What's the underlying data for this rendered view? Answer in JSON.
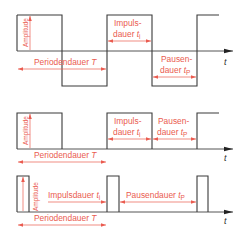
{
  "diagrams": [
    {
      "name": "symmetric-rectangular-wave",
      "labels": {
        "amplitude": "Amplitude",
        "impuls_line1": "Impuls-",
        "impuls_line2": "dauer ",
        "impuls_sym": "t",
        "impuls_sub": "i",
        "pause_line1": "Pausen-",
        "pause_line2": "dauer ",
        "pause_sym": "t",
        "pause_sub": "P",
        "period": "Periodendauer ",
        "period_sym": "T",
        "axis": "t"
      }
    },
    {
      "name": "unipolar-pulse-wave",
      "labels": {
        "amplitude": "Amplitude",
        "impuls_line1": "Impuls-",
        "impuls_line2": "dauer ",
        "impuls_sym": "t",
        "impuls_sub": "i",
        "pause_line1": "Pausen-",
        "pause_line2": "dauer ",
        "pause_sym": "t",
        "pause_sub": "P",
        "period": "Periodendauer ",
        "period_sym": "T",
        "axis": "t"
      }
    },
    {
      "name": "narrow-pulse-wave",
      "labels": {
        "amplitude": "Amplitude",
        "impuls": "Impulsdauer ",
        "impuls_sym": "t",
        "impuls_sub": "i",
        "pause": "Pausendauer ",
        "pause_sym": "t",
        "pause_sub": "P",
        "period": "Periodendauer ",
        "period_sym": "T",
        "axis": "t"
      }
    }
  ],
  "colors": {
    "waveform": "#3a3a3a",
    "annotation": "#ea5b4f",
    "axis": "#555555"
  }
}
